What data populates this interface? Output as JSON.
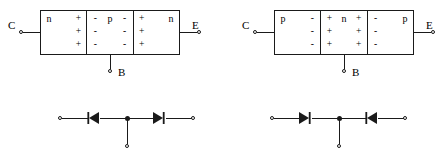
{
  "figure": {
    "type": "transistor-structure-and-diode-equivalent",
    "background_color": "#ffffff",
    "line_color": "#1a1a1a"
  },
  "transistors": [
    {
      "id": "npn",
      "type": "NPN",
      "terminals": {
        "collector": "C",
        "emitter": "E",
        "base": "B"
      },
      "regions": [
        {
          "name": "collector-region",
          "material": "n",
          "rows": [
            {
              "left": "n",
              "right": "+"
            },
            {
              "left": "",
              "right": "+"
            },
            {
              "left": "",
              "right": "+"
            }
          ]
        },
        {
          "name": "base-region",
          "material": "p",
          "rows": [
            {
              "left": "-",
              "center": "p",
              "right": "-"
            },
            {
              "left": "-",
              "center": "",
              "right": "-"
            },
            {
              "left": "-",
              "center": "",
              "right": "-"
            }
          ]
        },
        {
          "name": "emitter-region",
          "material": "n",
          "rows": [
            {
              "left": "+",
              "right": "n"
            },
            {
              "left": "+",
              "right": ""
            },
            {
              "left": "+",
              "right": ""
            }
          ]
        }
      ]
    },
    {
      "id": "pnp",
      "type": "PNP",
      "terminals": {
        "collector": "C",
        "emitter": "E",
        "base": "B"
      },
      "regions": [
        {
          "name": "collector-region",
          "material": "p",
          "rows": [
            {
              "left": "p",
              "right": "-"
            },
            {
              "left": "",
              "right": "-"
            },
            {
              "left": "",
              "right": "-"
            }
          ]
        },
        {
          "name": "base-region",
          "material": "n",
          "rows": [
            {
              "left": "+",
              "center": "n",
              "right": "+"
            },
            {
              "left": "+",
              "center": "",
              "right": "+"
            },
            {
              "left": "+",
              "center": "",
              "right": "+"
            }
          ]
        },
        {
          "name": "emitter-region",
          "material": "p",
          "rows": [
            {
              "left": "-",
              "right": "p"
            },
            {
              "left": "-",
              "right": ""
            },
            {
              "left": "-",
              "right": ""
            }
          ]
        }
      ]
    }
  ],
  "diode_circuits": [
    {
      "id": "npn-equivalent",
      "for": "NPN",
      "left_diode_direction": "left",
      "right_diode_direction": "right",
      "terminals": 3
    },
    {
      "id": "pnp-equivalent",
      "for": "PNP",
      "left_diode_direction": "right",
      "right_diode_direction": "left",
      "terminals": 3
    }
  ]
}
